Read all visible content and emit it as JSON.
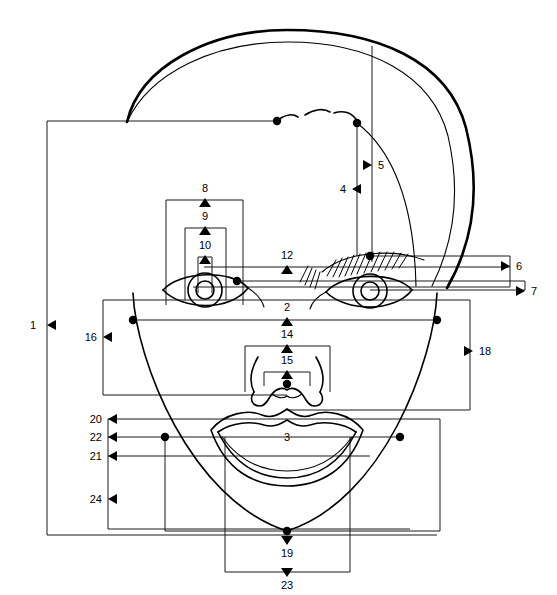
{
  "diagram": {
    "stroke_color": "#1a1a1a",
    "face_color": "#000000",
    "background": "#ffffff",
    "measurement_count": 24,
    "labels": [
      {
        "id": "1",
        "text": "1",
        "x": 36,
        "y": 329,
        "arrow": "left",
        "ax": 47,
        "ay": 325
      },
      {
        "id": "2",
        "text": "2",
        "x": 287,
        "y": 311,
        "arrow": "up",
        "ax": 287,
        "ay": 319
      },
      {
        "id": "3",
        "text": "3",
        "x": 287,
        "y": 441,
        "arrow": "none",
        "ax": 287,
        "ay": 437
      },
      {
        "id": "4",
        "text": "4",
        "x": 341,
        "y": 193,
        "arrow": "left",
        "ax": 352,
        "ay": 189
      },
      {
        "id": "5",
        "text": "5",
        "x": 383,
        "y": 169,
        "arrow": "right",
        "ax": 372,
        "ay": 165
      },
      {
        "id": "6",
        "text": "6",
        "x": 521,
        "y": 270,
        "arrow": "right",
        "ax": 510,
        "ay": 266
      },
      {
        "id": "7",
        "text": "7",
        "x": 536,
        "y": 295,
        "arrow": "right",
        "ax": 525,
        "ay": 291
      },
      {
        "id": "8",
        "text": "8",
        "x": 205,
        "y": 192,
        "arrow": "up",
        "ax": 205,
        "ay": 200
      },
      {
        "id": "9",
        "text": "9",
        "x": 205,
        "y": 220,
        "arrow": "up",
        "ax": 205,
        "ay": 228
      },
      {
        "id": "10",
        "text": "10",
        "x": 205,
        "y": 249,
        "arrow": "up",
        "ax": 205,
        "ay": 257
      },
      {
        "id": "12",
        "text": "12",
        "x": 287,
        "y": 259,
        "arrow": "up",
        "ax": 287,
        "ay": 267
      },
      {
        "id": "14",
        "text": "14",
        "x": 287,
        "y": 338,
        "arrow": "up",
        "ax": 287,
        "ay": 346
      },
      {
        "id": "15",
        "text": "15",
        "x": 287,
        "y": 364,
        "arrow": "up",
        "ax": 287,
        "ay": 372
      },
      {
        "id": "16",
        "text": "16",
        "x": 92,
        "y": 341,
        "arrow": "left",
        "ax": 103,
        "ay": 337
      },
      {
        "id": "18",
        "text": "18",
        "x": 484,
        "y": 355,
        "arrow": "right",
        "ax": 473,
        "ay": 351
      },
      {
        "id": "19",
        "text": "19",
        "x": 287,
        "y": 551,
        "arrow": "down",
        "ax": 287,
        "ay": 540
      },
      {
        "id": "20",
        "text": "20",
        "x": 97,
        "y": 423,
        "arrow": "left",
        "ax": 108,
        "ay": 419
      },
      {
        "id": "21",
        "text": "21",
        "x": 97,
        "y": 460,
        "arrow": "left",
        "ax": 108,
        "ay": 456
      },
      {
        "id": "22",
        "text": "22",
        "x": 97,
        "y": 441,
        "arrow": "left",
        "ax": 108,
        "ay": 437
      },
      {
        "id": "23",
        "text": "23",
        "x": 287,
        "y": 583,
        "arrow": "down",
        "ax": 287,
        "ay": 572
      },
      {
        "id": "24",
        "text": "24",
        "x": 97,
        "y": 503,
        "arrow": "left",
        "ax": 108,
        "ay": 499
      }
    ],
    "landmark_dots": [
      {
        "name": "glabella-left",
        "cx": 277,
        "cy": 121,
        "r": 4.2
      },
      {
        "name": "glabella-right",
        "cx": 357,
        "cy": 123,
        "r": 4.2
      },
      {
        "name": "nasion",
        "cx": 370,
        "cy": 256,
        "r": 4.2
      },
      {
        "name": "inner-canthus",
        "cx": 237,
        "cy": 281,
        "r": 4.2
      },
      {
        "name": "cheek-left",
        "cx": 133,
        "cy": 320,
        "r": 4.2
      },
      {
        "name": "cheek-right",
        "cx": 437,
        "cy": 320,
        "r": 4.2
      },
      {
        "name": "subnasale",
        "cx": 287,
        "cy": 384,
        "r": 4.2
      },
      {
        "name": "mouth-corner-left",
        "cx": 165,
        "cy": 437,
        "r": 4.2
      },
      {
        "name": "mouth-corner-right",
        "cx": 400,
        "cy": 437,
        "r": 4.2
      },
      {
        "name": "gnathion",
        "cx": 287,
        "cy": 531,
        "r": 4.2
      }
    ]
  }
}
